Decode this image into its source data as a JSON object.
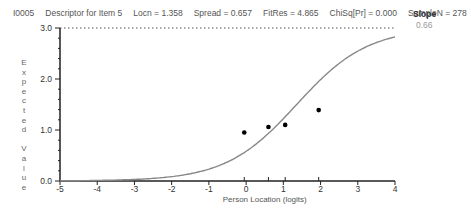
{
  "header": {
    "item_id": "I0005",
    "descriptor": "Descriptor for Item 5",
    "locn": "Locn = 1.358",
    "spread": "Spread = 0.657",
    "fitres": "FitRes = 4.865",
    "chisq": "ChiSq[Pr] = 0.000",
    "sample": "SampleN = 278"
  },
  "slope": {
    "label": "Slope",
    "value": "0.66"
  },
  "chart_data": {
    "type": "line",
    "xlabel": "Person Location (logits)",
    "ylabel": "Expected Value",
    "xlim": [
      -5,
      4
    ],
    "ylim": [
      0,
      3
    ],
    "x_ticks": [
      "-5",
      "-4",
      "-3",
      "-2",
      "-1",
      "0",
      "1",
      "2",
      "3",
      "4"
    ],
    "y_ticks": [
      "0.0",
      "1.0",
      "2.0",
      "3.0"
    ],
    "max_line": 3.0,
    "curve": {
      "name": "Expected value curve",
      "locn": 1.358,
      "slope": 0.66,
      "max": 3
    },
    "observed_points": [
      {
        "x": -0.05,
        "y": 0.95
      },
      {
        "x": 0.6,
        "y": 1.06
      },
      {
        "x": 1.05,
        "y": 1.1
      },
      {
        "x": 1.95,
        "y": 1.39
      }
    ],
    "class_interval_marks": [
      -0.05,
      0.6,
      1.05,
      1.95
    ],
    "grid": false
  }
}
